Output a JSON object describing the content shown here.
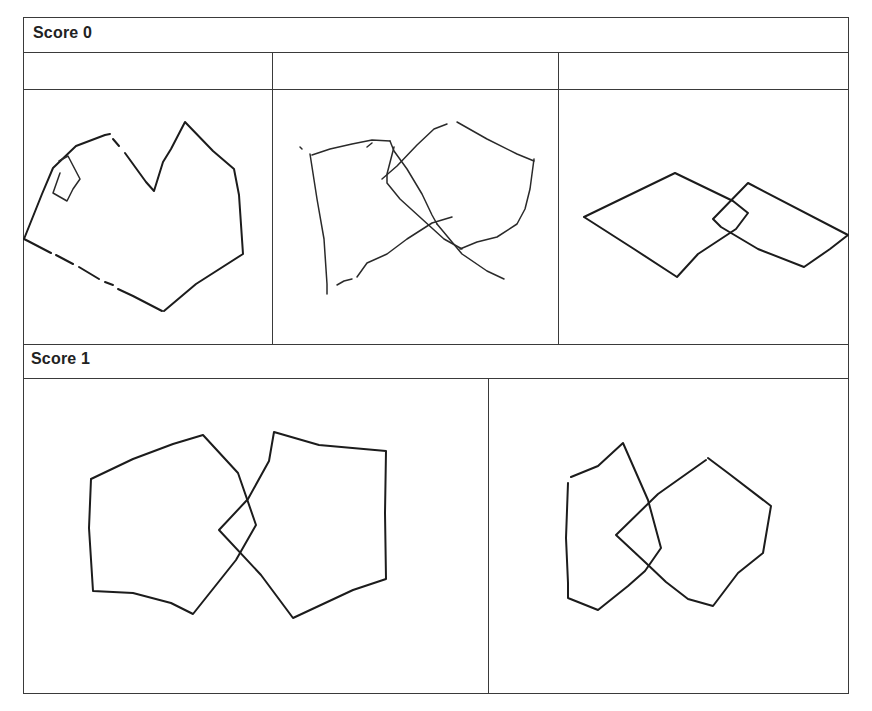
{
  "sections": [
    {
      "label": "Score 0",
      "header_cells": [
        "",
        "",
        ""
      ],
      "drawings": [
        {
          "name": "score0-drawing-1",
          "description": "Irregular heptagon-like shape with a small square attached on upper-left edge; not two intersecting pentagons"
        },
        {
          "name": "score0-drawing-2",
          "description": "Quadrilateral and pentagon loosely overlapping with broken, sketchy lines"
        },
        {
          "name": "score0-drawing-3",
          "description": "Two rhombi/quadrilaterals overlapping with a small square intersection"
        }
      ]
    },
    {
      "label": "Score 1",
      "drawings": [
        {
          "name": "score1-drawing-1",
          "description": "Two pentagons intersecting to form a four-sided figure (diamond)"
        },
        {
          "name": "score1-drawing-2",
          "description": "Two pentagons overlapping with a four-sided intersection"
        }
      ]
    }
  ],
  "colors": {
    "line": "#3a3a3a",
    "ink": "#1c1c1c",
    "background": "#ffffff"
  }
}
